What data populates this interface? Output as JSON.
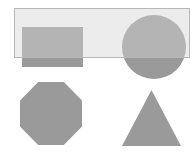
{
  "canvas": {
    "width": 196,
    "height": 152,
    "background_color": "#ffffff",
    "shape_fill_color": "#9a9a9a",
    "shapes": [
      {
        "type": "rectangle",
        "left": 22,
        "top": 27,
        "width": 61,
        "height": 40
      },
      {
        "type": "circle",
        "left": 122,
        "top": 15,
        "width": 64,
        "height": 64
      },
      {
        "type": "octagon",
        "left": 20,
        "top": 82,
        "width": 62,
        "height": 63
      },
      {
        "type": "triangle",
        "left": 122,
        "top": 90,
        "width": 59,
        "height": 56
      }
    ],
    "selection_marquee": {
      "left": 14,
      "top": 8,
      "width": 176,
      "height": 50,
      "fill_color": "rgba(213,213,213,0.45)",
      "border_color": "#b7b7b7"
    }
  }
}
